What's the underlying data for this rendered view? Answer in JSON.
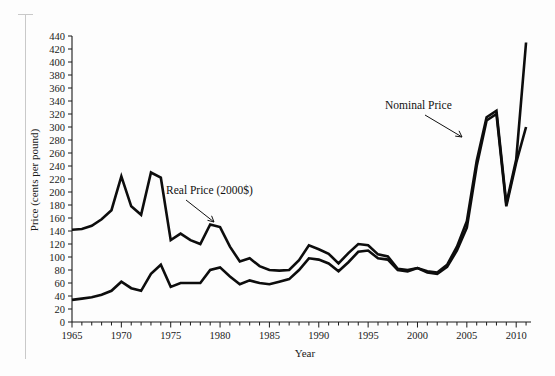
{
  "figure": {
    "background_color": "#fdfdfd",
    "line_color": "#0d0d0d"
  },
  "annotations": {
    "nominal_label": "Nominal Price",
    "real_label": "Real Price (2000$)"
  },
  "chart_data": {
    "type": "line",
    "title": "",
    "xlabel": "Year",
    "ylabel": "Price (cents per pound)",
    "xlim": [
      1965,
      2011.5
    ],
    "ylim": [
      0,
      440
    ],
    "grid": false,
    "legend": "annotated-inline",
    "y_ticks": [
      0,
      20,
      40,
      60,
      80,
      100,
      120,
      140,
      160,
      180,
      200,
      220,
      240,
      260,
      280,
      300,
      320,
      340,
      360,
      380,
      400,
      420,
      440
    ],
    "x_ticks": [
      1965,
      1966,
      1967,
      1968,
      1969,
      1970,
      1971,
      1972,
      1973,
      1974,
      1975,
      1976,
      1977,
      1978,
      1979,
      1980,
      1981,
      1982,
      1983,
      1984,
      1985,
      1986,
      1987,
      1988,
      1989,
      1990,
      1991,
      1992,
      1993,
      1994,
      1995,
      1996,
      1997,
      1998,
      1999,
      2000,
      2001,
      2002,
      2003,
      2004,
      2005,
      2006,
      2007,
      2008,
      2009,
      2010,
      2011
    ],
    "x_tick_labels": [
      1965,
      1970,
      1975,
      1980,
      1985,
      1990,
      1995,
      2000,
      2005,
      2010
    ],
    "x": [
      1965,
      1966,
      1967,
      1968,
      1969,
      1970,
      1971,
      1972,
      1973,
      1974,
      1975,
      1976,
      1977,
      1978,
      1979,
      1980,
      1981,
      1982,
      1983,
      1984,
      1985,
      1986,
      1987,
      1988,
      1989,
      1990,
      1991,
      1992,
      1993,
      1994,
      1995,
      1996,
      1997,
      1998,
      1999,
      2000,
      2001,
      2002,
      2003,
      2004,
      2005,
      2006,
      2007,
      2008,
      2009,
      2010,
      2011
    ],
    "series": [
      {
        "name": "Real Price (2000$)",
        "values": [
          142,
          143,
          148,
          158,
          172,
          224,
          178,
          165,
          230,
          222,
          126,
          136,
          126,
          120,
          150,
          146,
          116,
          93,
          98,
          86,
          80,
          79,
          80,
          95,
          118,
          112,
          105,
          90,
          106,
          120,
          118,
          104,
          101,
          82,
          80,
          83,
          76,
          74,
          85,
          110,
          145,
          240,
          310,
          320,
          178,
          245,
          300
        ]
      },
      {
        "name": "Nominal Price",
        "values": [
          34,
          36,
          38,
          42,
          48,
          62,
          52,
          48,
          74,
          88,
          54,
          60,
          60,
          60,
          80,
          84,
          70,
          58,
          64,
          60,
          58,
          62,
          66,
          80,
          98,
          96,
          90,
          78,
          92,
          108,
          110,
          98,
          96,
          80,
          78,
          83,
          78,
          76,
          88,
          116,
          155,
          248,
          315,
          325,
          182,
          250,
          430
        ]
      }
    ]
  }
}
